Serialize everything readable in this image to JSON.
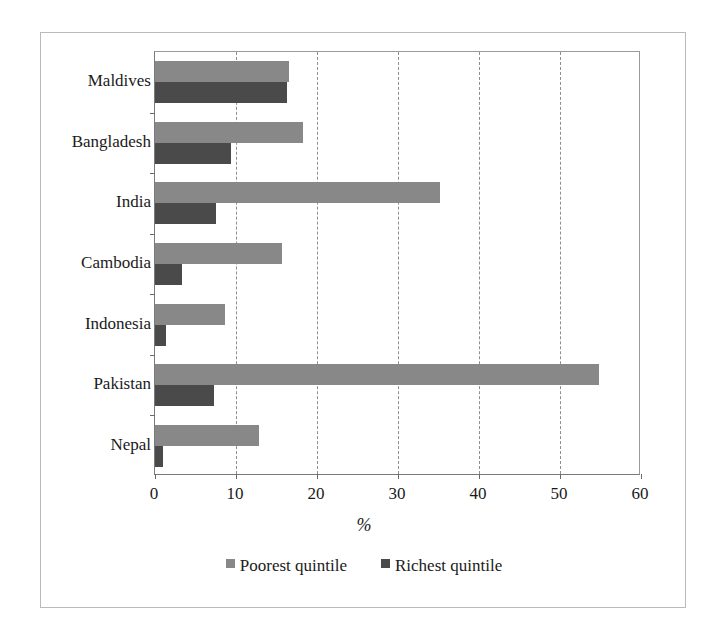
{
  "chart_data": {
    "type": "bar",
    "orientation": "horizontal",
    "title": "",
    "xlabel": "%",
    "ylabel": "",
    "xlim": [
      0,
      60
    ],
    "xticks": [
      0,
      10,
      20,
      30,
      40,
      50,
      60
    ],
    "grid": "vertical-dashed",
    "legend_position": "bottom-center",
    "categories": [
      "Maldives",
      "Bangladesh",
      "India",
      "Cambodia",
      "Indonesia",
      "Pakistan",
      "Nepal"
    ],
    "series": [
      {
        "name": "Poorest quintile",
        "color": "#888888",
        "values": [
          16.5,
          18.3,
          35.2,
          15.7,
          8.6,
          54.8,
          12.9
        ]
      },
      {
        "name": "Richest quintile",
        "color": "#4a4a4a",
        "values": [
          16.3,
          9.4,
          7.5,
          3.3,
          1.4,
          7.3,
          1.0
        ]
      }
    ]
  },
  "legend": {
    "items": [
      {
        "label": "Poorest quintile",
        "swatch": "#888888"
      },
      {
        "label": "Richest quintile",
        "swatch": "#4a4a4a"
      }
    ]
  }
}
